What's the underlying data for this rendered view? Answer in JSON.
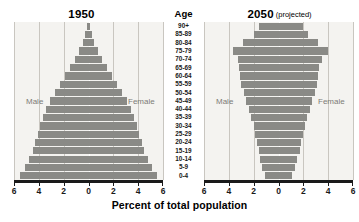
{
  "figure": {
    "xaxis_title": "Percent of total population",
    "age_column_header": "Age",
    "bar_color": "#8a8a86",
    "plot_background": "#f4f3f0",
    "gridline_color": "#c9c6c0",
    "axis_color": "#1a1a1a",
    "mf_label_color": "#7d7b77"
  },
  "panels": [
    {
      "id": "1950",
      "title": "1950",
      "subtitle": "",
      "male_label": "Male",
      "female_label": "Female",
      "tick_labels": [
        "6",
        "4",
        "2",
        "0",
        "2",
        "4",
        "6"
      ],
      "tick_values": [
        -6,
        -4,
        -2,
        0,
        2,
        4,
        6
      ]
    },
    {
      "id": "2050",
      "title": "2050",
      "subtitle": "(projected)",
      "male_label": "Male",
      "female_label": "Female",
      "tick_labels": [
        "6",
        "4",
        "2",
        "0",
        "2",
        "4",
        "6"
      ],
      "tick_values": [
        -6,
        -4,
        -2,
        0,
        2,
        4,
        6
      ]
    }
  ],
  "chart_data": {
    "type": "bar",
    "subtype": "population-pyramid",
    "xlabel": "Percent of total population",
    "ylabel": "Age",
    "xlim": [
      -6,
      6
    ],
    "xticks": [
      -6,
      -4,
      -2,
      0,
      2,
      4,
      6
    ],
    "xtick_labels": [
      "6",
      "4",
      "2",
      "0",
      "2",
      "4",
      "6"
    ],
    "grid": true,
    "legend": "inline-labels",
    "categories": [
      "90+",
      "85-89",
      "80-84",
      "75-79",
      "70-74",
      "65-69",
      "60-64",
      "55-59",
      "50-54",
      "45-49",
      "40-44",
      "35-39",
      "30-34",
      "25-29",
      "20-24",
      "15-19",
      "10-14",
      "5-9",
      "0-4"
    ],
    "panels": [
      {
        "name": "1950",
        "series": [
          {
            "name": "Male",
            "side": "left",
            "values": [
              0.1,
              0.25,
              0.45,
              0.75,
              1.1,
              1.5,
              1.9,
              2.3,
              2.7,
              3.1,
              3.4,
              3.7,
              3.9,
              4.1,
              4.3,
              4.5,
              4.8,
              5.1,
              5.5
            ]
          },
          {
            "name": "Female",
            "side": "right",
            "values": [
              0.1,
              0.25,
              0.45,
              0.75,
              1.1,
              1.5,
              1.9,
              2.3,
              2.7,
              3.1,
              3.4,
              3.7,
              3.9,
              4.1,
              4.3,
              4.5,
              4.8,
              5.1,
              5.5
            ]
          }
        ]
      },
      {
        "name": "2050",
        "series": [
          {
            "name": "Male",
            "side": "left",
            "values": [
              1.6,
              2.0,
              2.9,
              3.7,
              3.3,
              3.2,
              3.1,
              3.0,
              2.8,
              2.6,
              2.4,
              2.2,
              2.0,
              1.9,
              1.7,
              1.6,
              1.5,
              1.3,
              1.1
            ]
          },
          {
            "name": "Female",
            "side": "right",
            "values": [
              2.0,
              2.4,
              3.2,
              4.0,
              3.5,
              3.3,
              3.2,
              3.1,
              2.9,
              2.7,
              2.5,
              2.3,
              2.1,
              2.0,
              1.8,
              1.7,
              1.5,
              1.3,
              1.1
            ]
          }
        ]
      }
    ]
  }
}
